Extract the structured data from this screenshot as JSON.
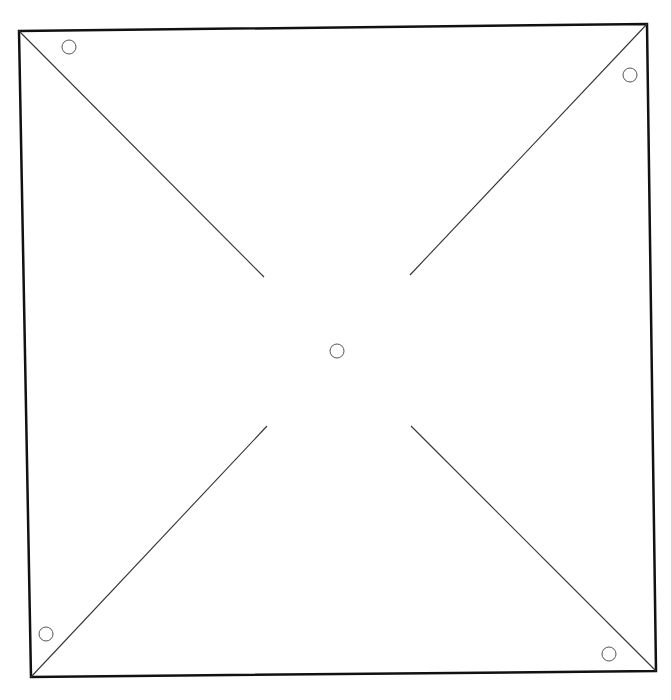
{
  "diagram": {
    "title": "",
    "type": "pinwheel-template",
    "colors": {
      "background": "#ffffff",
      "outline": "#111111",
      "cut_line": "#333333",
      "hole": "#555555"
    },
    "square": {
      "corners": {
        "top_left": [
          19,
          31
        ],
        "top_right": [
          647,
          24
        ],
        "bottom_right": [
          656,
          671
        ],
        "bottom_left": [
          31,
          677
        ]
      },
      "stroke_width": 2.5
    },
    "cut_lines": [
      {
        "name": "cut-line-top-left",
        "from": [
          19,
          31
        ],
        "to": [
          264,
          277
        ]
      },
      {
        "name": "cut-line-top-right",
        "from": [
          647,
          24
        ],
        "to": [
          410,
          275
        ]
      },
      {
        "name": "cut-line-bottom-left",
        "from": [
          31,
          677
        ],
        "to": [
          267,
          426
        ]
      },
      {
        "name": "cut-line-bottom-right",
        "from": [
          656,
          671
        ],
        "to": [
          411,
          426
        ]
      }
    ],
    "holes": [
      {
        "name": "hole-top-left",
        "cx": 69,
        "cy": 47,
        "r": 7
      },
      {
        "name": "hole-top-right",
        "cx": 630,
        "cy": 75,
        "r": 7
      },
      {
        "name": "hole-bottom-left",
        "cx": 46,
        "cy": 634,
        "r": 7
      },
      {
        "name": "hole-bottom-right",
        "cx": 609,
        "cy": 654,
        "r": 7
      },
      {
        "name": "hole-center",
        "cx": 337,
        "cy": 351,
        "r": 7
      }
    ]
  }
}
